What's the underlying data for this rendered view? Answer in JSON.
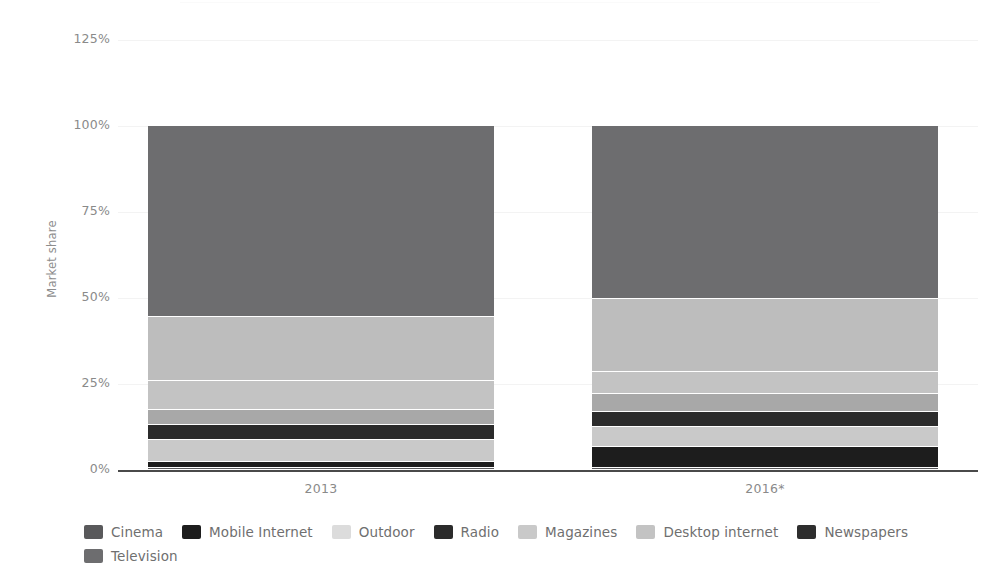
{
  "chart_data": {
    "type": "bar",
    "subtype": "stacked-bar-100-percent",
    "title": "",
    "xlabel": "",
    "ylabel": "Market share",
    "categories": [
      "2013",
      "2016*"
    ],
    "ylim": [
      0,
      125
    ],
    "yticks": [
      "0%",
      "25%",
      "50%",
      "75%",
      "100%",
      "125%"
    ],
    "ytick_values": [
      0,
      25,
      50,
      75,
      100,
      125
    ],
    "ytick_format": "percent",
    "grid": true,
    "legend_position": "bottom",
    "footnote_marker": "*",
    "series": [
      {
        "name": "Cinema",
        "color": "#59595b",
        "values": [
          0.6,
          0.6
        ]
      },
      {
        "name": "Mobile Internet",
        "color": "#1d1d1d",
        "values": [
          1.7,
          6.7
        ]
      },
      {
        "name": "Outdoor",
        "color": "#c9c9c9",
        "values": [
          6.4,
          5.8
        ]
      },
      {
        "name": "Radio",
        "color": "#2b2b2b",
        "values": [
          4.4,
          4.4
        ]
      },
      {
        "name": "Magazines",
        "color": "#a8a8a8",
        "values": [
          4.3,
          5.2
        ]
      },
      {
        "name": "Desktop internet",
        "color": "#c3c3c3",
        "values": [
          8.5,
          6.4
        ]
      },
      {
        "name": "Newspapers",
        "color": "#bdbdbd",
        "values": [
          18.6,
          21.2
        ]
      },
      {
        "name": "Television",
        "color": "#6d6d6f",
        "values": [
          55.5,
          49.7
        ]
      }
    ],
    "stack_order_bottom_to_top": [
      "Cinema",
      "Mobile Internet",
      "Outdoor",
      "Radio",
      "Magazines",
      "Desktop internet",
      "Newspapers",
      "Television"
    ],
    "bars": [
      {
        "category": "2013",
        "segments": [
          {
            "name": "Cinema",
            "value": 0.6,
            "cum_bottom": 0.0,
            "cum_top": 0.6,
            "color": "#59595b"
          },
          {
            "name": "Mobile Internet",
            "value": 1.7,
            "cum_bottom": 0.6,
            "cum_top": 2.3,
            "color": "#1d1d1d"
          },
          {
            "name": "Outdoor",
            "value": 6.4,
            "cum_bottom": 2.3,
            "cum_top": 8.7,
            "color": "#c9c9c9"
          },
          {
            "name": "Radio",
            "value": 4.4,
            "cum_bottom": 8.7,
            "cum_top": 13.1,
            "color": "#2b2b2b"
          },
          {
            "name": "Magazines",
            "value": 4.3,
            "cum_bottom": 13.1,
            "cum_top": 17.4,
            "color": "#a8a8a8"
          },
          {
            "name": "Desktop internet",
            "value": 8.5,
            "cum_bottom": 17.4,
            "cum_top": 25.9,
            "color": "#c3c3c3"
          },
          {
            "name": "Newspapers",
            "value": 18.6,
            "cum_bottom": 25.9,
            "cum_top": 44.5,
            "color": "#bdbdbd"
          },
          {
            "name": "Television",
            "value": 55.5,
            "cum_bottom": 44.5,
            "cum_top": 100.0,
            "color": "#6d6d6f"
          }
        ]
      },
      {
        "category": "2016*",
        "segments": [
          {
            "name": "Cinema",
            "value": 0.6,
            "cum_bottom": 0.0,
            "cum_top": 0.6,
            "color": "#59595b"
          },
          {
            "name": "Mobile Internet",
            "value": 6.1,
            "cum_bottom": 0.6,
            "cum_top": 6.7,
            "color": "#1d1d1d"
          },
          {
            "name": "Outdoor",
            "value": 5.8,
            "cum_bottom": 6.7,
            "cum_top": 12.5,
            "color": "#c9c9c9"
          },
          {
            "name": "Radio",
            "value": 4.4,
            "cum_bottom": 12.5,
            "cum_top": 16.9,
            "color": "#2b2b2b"
          },
          {
            "name": "Magazines",
            "value": 5.2,
            "cum_bottom": 16.9,
            "cum_top": 22.1,
            "color": "#a8a8a8"
          },
          {
            "name": "Desktop internet",
            "value": 6.4,
            "cum_bottom": 22.1,
            "cum_top": 28.5,
            "color": "#c3c3c3"
          },
          {
            "name": "Newspapers",
            "value": 21.2,
            "cum_bottom": 28.5,
            "cum_top": 49.7,
            "color": "#bdbdbd"
          },
          {
            "name": "Television",
            "value": 50.3,
            "cum_bottom": 49.7,
            "cum_top": 100.0,
            "color": "#6d6d6f"
          }
        ]
      }
    ]
  },
  "axis": {
    "y_label": "Market share",
    "y_ticks": [
      {
        "label": "125%",
        "value": 125
      },
      {
        "label": "100%",
        "value": 100
      },
      {
        "label": "75%",
        "value": 75
      },
      {
        "label": "50%",
        "value": 50
      },
      {
        "label": "25%",
        "value": 25
      },
      {
        "label": "0%",
        "value": 0
      }
    ],
    "x_ticks": [
      {
        "label": "2013"
      },
      {
        "label": "2016*"
      }
    ]
  },
  "legend": {
    "items": [
      {
        "label": "Cinema",
        "color": "#59595b"
      },
      {
        "label": "Mobile Internet",
        "color": "#1d1d1d"
      },
      {
        "label": "Outdoor",
        "color": "#dcdcdc"
      },
      {
        "label": "Radio",
        "color": "#2b2b2b"
      },
      {
        "label": "Magazines",
        "color": "#c9c9c9"
      },
      {
        "label": "Desktop internet",
        "color": "#c3c3c3"
      },
      {
        "label": "Newspapers",
        "color": "#2e2e2e"
      },
      {
        "label": "Television",
        "color": "#6d6d6f"
      }
    ]
  }
}
